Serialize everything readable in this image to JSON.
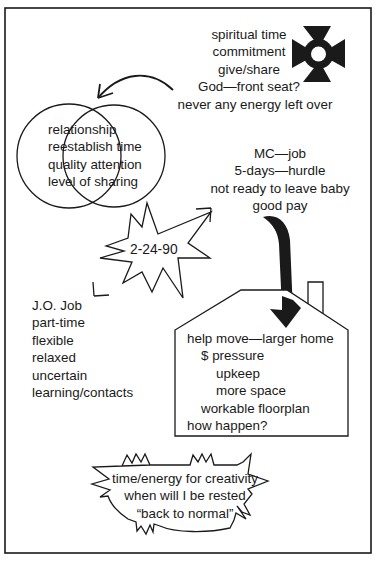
{
  "colors": {
    "ink": "#1a1a1a",
    "paper": "#ffffff"
  },
  "spiritual": {
    "icon": "maltese-cross-icon",
    "lines": [
      "spiritual time",
      "commitment",
      "give/share",
      "God—front seat?",
      "never any energy left over"
    ]
  },
  "relationship": {
    "shape": "venn-diagram",
    "lines": [
      "relationship",
      "reestablish time",
      "quality attention",
      "level of sharing"
    ]
  },
  "mc_job": {
    "lines": [
      "MC—job",
      "5-days—hurdle",
      "not ready to leave baby",
      "good pay"
    ]
  },
  "date_burst": {
    "shape": "starburst",
    "label": "2-24-90"
  },
  "jo_job": {
    "lines": [
      "J.O. Job",
      "part-time",
      "flexible",
      "relaxed",
      "uncertain",
      "learning/contacts"
    ]
  },
  "home": {
    "shape": "house",
    "lines": [
      "help move—larger home",
      "$ pressure",
      "upkeep",
      "more space",
      "workable floorplan",
      "how happen?"
    ]
  },
  "creativity": {
    "shape": "jagged-speech-bubble",
    "lines": [
      "time/energy for creativity",
      "when will I be rested",
      "“back to normal”"
    ]
  }
}
